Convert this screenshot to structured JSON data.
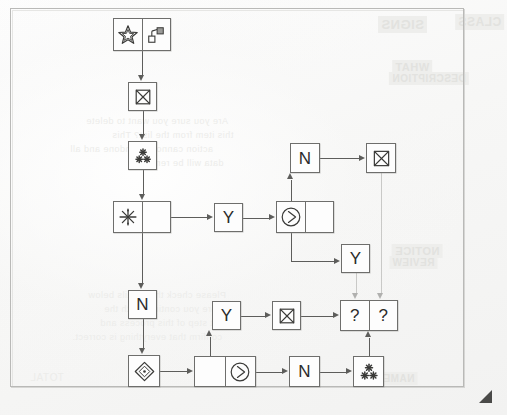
{
  "document": {
    "type": "hand-drawn flowchart scan",
    "frame_present": true,
    "dog_ear_corner": "bottom-right"
  },
  "ghost_text": [
    {
      "text": "SIGNS",
      "x": 378,
      "y": 16,
      "size": 13,
      "block": true
    },
    {
      "text": "CLASS",
      "x": 455,
      "y": 14,
      "size": 12,
      "block": true
    },
    {
      "text": "WHAT",
      "x": 392,
      "y": 60,
      "size": 11,
      "block": true
    },
    {
      "text": "DESCRIPTION",
      "x": 389,
      "y": 72,
      "size": 10,
      "block": true
    },
    {
      "text": "Are you sure you want to delete",
      "x": 86,
      "y": 116,
      "size": 9,
      "block": false
    },
    {
      "text": "this item from the list? This",
      "x": 112,
      "y": 130,
      "size": 9,
      "block": false
    },
    {
      "text": "action cannot be undone and all",
      "x": 70,
      "y": 144,
      "size": 9,
      "block": false
    },
    {
      "text": "data will be removed.",
      "x": 128,
      "y": 158,
      "size": 9,
      "block": false
    },
    {
      "text": "NOTICE",
      "x": 392,
      "y": 244,
      "size": 11,
      "block": true
    },
    {
      "text": "REVIEW",
      "x": 389,
      "y": 256,
      "size": 10,
      "block": true
    },
    {
      "text": "Please check the details below",
      "x": 88,
      "y": 290,
      "size": 9,
      "block": false
    },
    {
      "text": "before you continue with the",
      "x": 104,
      "y": 304,
      "size": 9,
      "block": false
    },
    {
      "text": "next step of this process and",
      "x": 100,
      "y": 318,
      "size": 9,
      "block": false
    },
    {
      "text": "confirm that everything is correct.",
      "x": 72,
      "y": 332,
      "size": 9,
      "block": false
    },
    {
      "text": "NAME",
      "x": 380,
      "y": 372,
      "size": 10,
      "block": true
    },
    {
      "text": "TOTAL",
      "x": 30,
      "y": 372,
      "size": 10,
      "block": false
    }
  ],
  "chart_data": {
    "type": "diagram",
    "title": "",
    "layout": "flowchart / pipeline graph",
    "nodes": [
      {
        "id": "n1",
        "x": 113,
        "y": 18,
        "w": 58,
        "h": 33,
        "cells": [
          {
            "icon": "star-icon",
            "label": ""
          },
          {
            "icon": "music-note-icon",
            "label": ""
          }
        ]
      },
      {
        "id": "n2",
        "x": 128,
        "y": 82,
        "w": 29,
        "h": 29,
        "cells": [
          {
            "icon": "bowtie-join-icon",
            "label": ""
          }
        ]
      },
      {
        "id": "n3",
        "x": 128,
        "y": 141,
        "w": 29,
        "h": 29,
        "cells": [
          {
            "icon": "three-asterisk-icon",
            "label": ""
          }
        ]
      },
      {
        "id": "n4",
        "x": 113,
        "y": 201,
        "w": 58,
        "h": 32,
        "cells": [
          {
            "icon": "sparkle-asterisk-icon",
            "label": ""
          },
          {
            "icon": "",
            "label": ""
          }
        ]
      },
      {
        "id": "n5",
        "x": 214,
        "y": 203,
        "w": 29,
        "h": 29,
        "cells": [
          {
            "icon": "",
            "label": "Y"
          }
        ]
      },
      {
        "id": "n6",
        "x": 276,
        "y": 201,
        "w": 58,
        "h": 32,
        "cells": [
          {
            "icon": "circle-play-icon",
            "label": ""
          },
          {
            "icon": "",
            "label": ""
          }
        ]
      },
      {
        "id": "n7",
        "x": 290,
        "y": 143,
        "w": 30,
        "h": 30,
        "cells": [
          {
            "icon": "",
            "label": "N"
          }
        ]
      },
      {
        "id": "n8",
        "x": 366,
        "y": 143,
        "w": 30,
        "h": 30,
        "cells": [
          {
            "icon": "bowtie-join-icon",
            "label": ""
          }
        ]
      },
      {
        "id": "n9",
        "x": 341,
        "y": 244,
        "w": 29,
        "h": 29,
        "cells": [
          {
            "icon": "",
            "label": "Y"
          }
        ]
      },
      {
        "id": "n10",
        "x": 128,
        "y": 290,
        "w": 29,
        "h": 29,
        "cells": [
          {
            "icon": "",
            "label": "N"
          }
        ]
      },
      {
        "id": "n11",
        "x": 212,
        "y": 301,
        "w": 29,
        "h": 29,
        "cells": [
          {
            "icon": "",
            "label": "Y"
          }
        ]
      },
      {
        "id": "n12",
        "x": 272,
        "y": 301,
        "w": 29,
        "h": 29,
        "cells": [
          {
            "icon": "bowtie-join-icon",
            "label": ""
          }
        ]
      },
      {
        "id": "n13",
        "x": 340,
        "y": 300,
        "w": 58,
        "h": 31,
        "cells": [
          {
            "icon": "",
            "label": "?"
          },
          {
            "icon": "",
            "label": "?"
          }
        ]
      },
      {
        "id": "n14",
        "x": 128,
        "y": 355,
        "w": 32,
        "h": 32,
        "cells": [
          {
            "icon": "diamond-dot-icon",
            "label": ""
          }
        ]
      },
      {
        "id": "n15",
        "x": 194,
        "y": 356,
        "w": 62,
        "h": 31,
        "cells": [
          {
            "icon": "",
            "label": ""
          },
          {
            "icon": "circle-play-icon",
            "label": ""
          }
        ]
      },
      {
        "id": "n16",
        "x": 289,
        "y": 356,
        "w": 31,
        "h": 31,
        "cells": [
          {
            "icon": "",
            "label": "N"
          }
        ]
      },
      {
        "id": "n17",
        "x": 353,
        "y": 356,
        "w": 31,
        "h": 31,
        "cells": [
          {
            "icon": "three-asterisk-icon",
            "label": ""
          }
        ]
      }
    ],
    "edges": [
      {
        "from": "n1",
        "to": "n2",
        "dir": "down"
      },
      {
        "from": "n2",
        "to": "n3",
        "dir": "down"
      },
      {
        "from": "n3",
        "to": "n4",
        "dir": "down"
      },
      {
        "from": "n4",
        "to": "n5",
        "dir": "right"
      },
      {
        "from": "n5",
        "to": "n6",
        "dir": "right"
      },
      {
        "from": "n6",
        "to": "n7",
        "dir": "up"
      },
      {
        "from": "n7",
        "to": "n8",
        "dir": "right"
      },
      {
        "from": "n6",
        "to": "n9",
        "dir": "down-right"
      },
      {
        "from": "n9",
        "to": "n13",
        "dir": "down"
      },
      {
        "from": "n8",
        "to": "n13",
        "dir": "down"
      },
      {
        "from": "n4",
        "to": "n10",
        "dir": "down"
      },
      {
        "from": "n10",
        "to": "n14",
        "dir": "down"
      },
      {
        "from": "n14",
        "to": "n15",
        "dir": "right"
      },
      {
        "from": "n15",
        "to": "n11",
        "dir": "up"
      },
      {
        "from": "n11",
        "to": "n12",
        "dir": "right"
      },
      {
        "from": "n12",
        "to": "n13",
        "dir": "right"
      },
      {
        "from": "n15",
        "to": "n16",
        "dir": "right"
      },
      {
        "from": "n16",
        "to": "n17",
        "dir": "right"
      },
      {
        "from": "n17",
        "to": "n13",
        "dir": "up"
      }
    ],
    "legend": []
  },
  "icons": {
    "star": "star-icon",
    "music_note": "music-note-icon",
    "bowtie": "bowtie-join-icon",
    "three_asterisk": "three-asterisk-icon",
    "sparkle": "sparkle-asterisk-icon",
    "circle_play": "circle-play-icon",
    "diamond_dot": "diamond-dot-icon"
  },
  "colors": {
    "ink": "#2b2b2a",
    "node_border": "#6e6e6c",
    "connector": "#5d5d5b",
    "paper": "#f7f7f6",
    "frame": "#b9b9b7",
    "ghost": "#ececea"
  }
}
